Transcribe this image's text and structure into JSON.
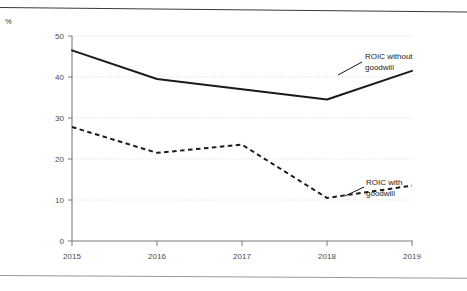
{
  "unit_label": "%",
  "annotations": {
    "without_goodwill": {
      "line1": "ROIC without",
      "line2": "goodwill"
    },
    "with_goodwill": {
      "line1": "ROIC with",
      "line2": "goodwill"
    }
  },
  "colors": {
    "series_without_goodwill": "#1a1a1a",
    "series_with_goodwill": "#1a1a1a",
    "axis": "#6a6a6a",
    "gridline": "#d8d8d8",
    "tick_label": "#4a4a4a",
    "rule": "#3a3a3a",
    "background": "#ffffff"
  },
  "chart_data": {
    "type": "line",
    "title": "",
    "subtitle": "",
    "xlabel": "",
    "ylabel": "%",
    "x": [
      "2015",
      "2016",
      "2017",
      "2018",
      "2019"
    ],
    "categories": [
      "2015",
      "2016",
      "2017",
      "2018",
      "2019"
    ],
    "series": [
      {
        "name": "ROIC without goodwill",
        "style": "solid",
        "values": [
          46.5,
          39.5,
          37.0,
          34.5,
          41.5
        ]
      },
      {
        "name": "ROIC with goodwill",
        "style": "dashed",
        "values": [
          27.8,
          21.5,
          23.5,
          10.5,
          13.5
        ]
      }
    ],
    "ylim": [
      0,
      50
    ],
    "yticks": [
      0,
      10,
      20,
      30,
      40,
      50
    ],
    "ytick_labels": [
      "0",
      "10",
      "20",
      "30",
      "40",
      "50"
    ],
    "xtick_labels": [
      "2015",
      "2016",
      "2017",
      "2018",
      "2019"
    ],
    "grid": true,
    "grid_axis": "y",
    "legend": "inline-annotations"
  }
}
